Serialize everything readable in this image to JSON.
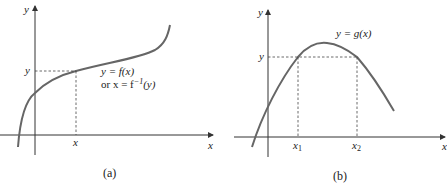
{
  "panel_a": {
    "caption": "(a)",
    "y_axis_label": "y",
    "x_axis_label": "x",
    "level_label": "y",
    "point_label": "x",
    "curve_label_line1": "y = f(x)",
    "curve_label_line2_prefix": "or x = f",
    "curve_label_line2_sup": "−1",
    "curve_label_line2_suffix": "(y)"
  },
  "panel_b": {
    "caption": "(b)",
    "y_axis_label": "y",
    "x_axis_label": "x",
    "level_label": "y",
    "point1_label": "x",
    "point1_sub": "1",
    "point2_label": "x",
    "point2_sub": "2",
    "curve_label": "y = g(x)"
  },
  "colors": {
    "curve": "#666666",
    "axis": "#333333",
    "text": "#222222"
  }
}
